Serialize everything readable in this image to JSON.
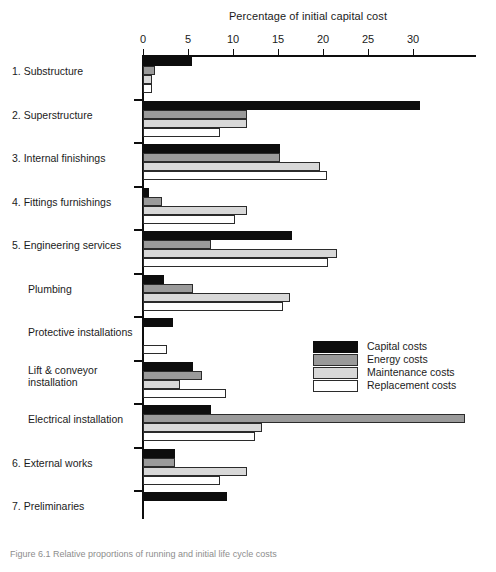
{
  "chart_data": {
    "type": "bar",
    "orientation": "horizontal",
    "title": "Percentage of initial capital cost",
    "xlabel": "Percentage of initial capital cost",
    "ylabel": "",
    "xlim": [
      0,
      37
    ],
    "xticks": [
      0,
      5,
      10,
      15,
      20,
      25,
      30
    ],
    "grid": false,
    "legend_position": "middle-right",
    "categories": [
      "1. Substructure",
      "2. Superstructure",
      "3. Internal finishings",
      "4. Fittings furnishings",
      "5. Engineering services",
      "Plumbing",
      "Protective installations",
      "Lift & conveyor\ninstallation",
      "Electrical installation",
      "6. External works",
      "7. Preliminaries"
    ],
    "series": [
      {
        "name": "Capital costs",
        "color": "#0d0d0d",
        "values": [
          5.4,
          30.8,
          15.2,
          0.7,
          16.6,
          2.3,
          3.3,
          5.5,
          7.6,
          3.5,
          9.3
        ]
      },
      {
        "name": "Energy costs",
        "color": "#9a9a9a",
        "values": [
          1.3,
          11.5,
          15.2,
          2.1,
          7.5,
          5.5,
          0.0,
          6.5,
          35.8,
          3.5,
          0.0
        ]
      },
      {
        "name": "Maintenance costs",
        "color": "#d8d8d8",
        "values": [
          1.0,
          11.5,
          19.7,
          11.6,
          21.6,
          16.3,
          0.0,
          4.1,
          13.2,
          11.6,
          0.0
        ]
      },
      {
        "name": "Replacement costs",
        "color": "#ffffff",
        "values": [
          1.0,
          8.5,
          20.4,
          10.2,
          20.6,
          15.6,
          2.7,
          9.2,
          12.4,
          8.5,
          0.0
        ]
      }
    ]
  },
  "legend": {
    "items": [
      {
        "label": "Capital costs",
        "swatch": "capital"
      },
      {
        "label": "Energy costs",
        "swatch": "energy"
      },
      {
        "label": "Maintenance costs",
        "swatch": "maint"
      },
      {
        "label": "Replacement costs",
        "swatch": "replace"
      }
    ]
  },
  "caption": {
    "text": "Figure 6.1  Relative proportions of running and initial life cycle costs"
  }
}
